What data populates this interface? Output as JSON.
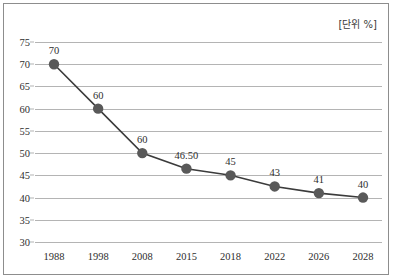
{
  "unit_note": "[단위 %]",
  "chart_data": {
    "type": "line",
    "title": "",
    "subtitle": "",
    "xlabel": "",
    "ylabel": "",
    "unit": "[단위 %]",
    "categories": [
      "1988",
      "1998",
      "2008",
      "2015",
      "2018",
      "2022",
      "2026",
      "2028"
    ],
    "values": [
      70,
      60,
      50,
      46.5,
      45,
      42.5,
      41,
      40
    ],
    "point_labels": [
      "70",
      "60",
      "60",
      "46.50",
      "45",
      "43",
      "41",
      "40"
    ],
    "series": [
      {
        "name": "",
        "values": [
          70,
          60,
          50,
          46.5,
          45,
          42.5,
          41,
          40
        ]
      }
    ],
    "yticks": [
      75,
      70,
      65,
      60,
      55,
      50,
      45,
      40,
      35,
      30
    ],
    "ytick_labels": [
      "75",
      "70",
      "65",
      "60",
      "55",
      "50",
      "45",
      "40",
      "35",
      "30"
    ],
    "ylim": [
      30,
      75
    ],
    "grid": true,
    "legend": "none",
    "colors": {
      "line": "#3b3b3b",
      "marker": "#595959",
      "gridline": "#b4b4b4",
      "border": "#8d8d8d",
      "text": "#2e2e2e",
      "background": "#ffffff"
    }
  }
}
